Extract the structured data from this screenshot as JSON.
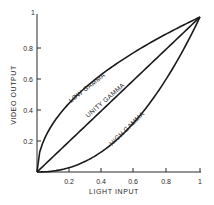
{
  "chart_data": {
    "type": "line",
    "title": "",
    "xlabel": "LIGHT INPUT",
    "ylabel": "VIDEO OUTPUT",
    "xlim": [
      0,
      1
    ],
    "ylim": [
      0,
      1
    ],
    "grid": false,
    "x_ticks": [
      "0.2",
      "0.4",
      "0.6",
      "0.8",
      "1"
    ],
    "y_ticks": [
      "0.2",
      "0.4",
      "0.6",
      "0.8",
      "1"
    ],
    "x_tick_values": [
      0.2,
      0.4,
      0.6,
      0.8,
      1.0
    ],
    "y_tick_values": [
      0.2,
      0.4,
      0.6,
      0.8,
      1.0
    ],
    "x": [
      0,
      0.1,
      0.2,
      0.3,
      0.4,
      0.5,
      0.6,
      0.7,
      0.8,
      0.9,
      1.0
    ],
    "series": [
      {
        "name": "LOW GAMMA",
        "gamma": 0.5,
        "values": [
          0,
          0.32,
          0.45,
          0.55,
          0.63,
          0.71,
          0.77,
          0.84,
          0.89,
          0.95,
          1.0
        ]
      },
      {
        "name": "UNITY GAMMA",
        "gamma": 1.0,
        "values": [
          0,
          0.1,
          0.2,
          0.3,
          0.4,
          0.5,
          0.6,
          0.7,
          0.8,
          0.9,
          1.0
        ]
      },
      {
        "name": "HIGH GAMMA",
        "gamma": 2.2,
        "values": [
          0,
          0.01,
          0.03,
          0.07,
          0.13,
          0.22,
          0.32,
          0.46,
          0.61,
          0.79,
          1.0
        ]
      }
    ],
    "annotations": [
      "LOW GAMMA",
      "UNITY GAMMA",
      "HIGH GAMMA"
    ],
    "line_color": "#1a1a1a"
  },
  "labels": {
    "low": "LOW GAMMA",
    "unity": "UNITY GAMMA",
    "high": "HIGH GAMMA",
    "xlabel": "LIGHT INPUT",
    "ylabel": "VIDEO OUTPUT",
    "x_ticks": [
      "0.2",
      "0.4",
      "0.6",
      "0.8",
      "1"
    ],
    "y_ticks": [
      "0.2",
      "0.4",
      "0.6",
      "0.8",
      "1"
    ]
  }
}
